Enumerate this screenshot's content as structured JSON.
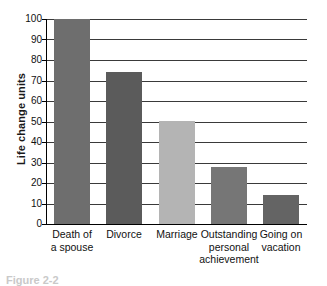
{
  "chart_data": {
    "type": "bar",
    "title": "",
    "xlabel": "",
    "ylabel": "Life change units",
    "ylim": [
      0,
      100
    ],
    "yticks": [
      0,
      10,
      20,
      30,
      40,
      50,
      60,
      70,
      80,
      90,
      100
    ],
    "grid": true,
    "legend": null,
    "categories": [
      "Death of a spouse",
      "Divorce",
      "Marriage",
      "Outstanding personal achievement",
      "Going on vacation"
    ],
    "category_lines": [
      [
        "Death of",
        "a spouse"
      ],
      [
        "Divorce"
      ],
      [
        "Marriage"
      ],
      [
        "Outstanding",
        "personal",
        "achievement"
      ],
      [
        "Going on",
        "vacation"
      ]
    ],
    "values": [
      100,
      74,
      50,
      28,
      14
    ],
    "bar_colors": [
      "#6e6e6e",
      "#5b5b5b",
      "#b4b4b4",
      "#767676",
      "#646464"
    ]
  },
  "axis": {
    "y_title": "Life change units",
    "tick_labels": [
      "100",
      "90",
      "80",
      "70",
      "60",
      "50",
      "40",
      "30",
      "20",
      "10",
      "0"
    ]
  },
  "caption": {
    "text": "Figure 2-2"
  },
  "colors": {
    "axis": "#000000",
    "gridline": "#3a3a3a",
    "text": "#111111",
    "background": "#ffffff"
  }
}
